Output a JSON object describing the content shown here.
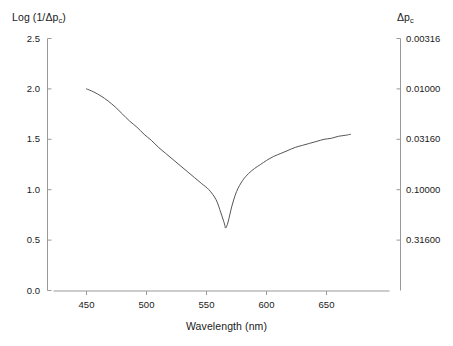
{
  "chart_data": {
    "type": "line",
    "title": "",
    "xlabel": "Wavelength (nm)",
    "ylabel": "Log (1/Δp_c)",
    "ylabel_right": "Δp_c",
    "xlim": [
      420,
      680
    ],
    "ylim": [
      0.0,
      2.5
    ],
    "grid": false,
    "legend": null,
    "xticks": [
      450,
      500,
      550,
      600,
      650
    ],
    "xticklabels": [
      "450",
      "500",
      "550",
      "600",
      "650"
    ],
    "yticks": [
      0.0,
      0.5,
      1.0,
      1.5,
      2.0,
      2.5
    ],
    "yticklabels": [
      "0.0",
      "0.5",
      "1.0",
      "1.5",
      "2.0",
      "2.5"
    ],
    "yticks_right_positions": [
      2.5,
      2.0,
      1.5,
      1.0,
      0.5
    ],
    "yticklabels_right": [
      "0.00316",
      "0.01000",
      "0.03160",
      "0.10000",
      "0.31600"
    ],
    "line_color": "#555555",
    "axis_color": "#999999",
    "series": [
      {
        "name": "spectral sensitivity",
        "x": [
          450,
          456,
          462,
          468,
          474,
          480,
          486,
          492,
          498,
          504,
          510,
          516,
          522,
          528,
          534,
          540,
          546,
          552,
          558,
          562,
          565,
          566,
          568,
          571,
          575,
          580,
          585,
          590,
          595,
          600,
          606,
          612,
          618,
          624,
          630,
          636,
          642,
          648,
          654,
          660,
          666,
          670
        ],
        "y": [
          2.0,
          1.97,
          1.93,
          1.88,
          1.82,
          1.75,
          1.68,
          1.62,
          1.55,
          1.49,
          1.42,
          1.36,
          1.3,
          1.24,
          1.18,
          1.12,
          1.06,
          1.0,
          0.9,
          0.77,
          0.66,
          0.62,
          0.68,
          0.83,
          0.98,
          1.09,
          1.16,
          1.21,
          1.25,
          1.29,
          1.33,
          1.36,
          1.39,
          1.42,
          1.44,
          1.46,
          1.48,
          1.5,
          1.51,
          1.53,
          1.54,
          1.55
        ]
      }
    ]
  },
  "labels": {
    "left_axis_title_prefix": "Log (1/Δp",
    "left_axis_title_sub": "c",
    "left_axis_title_suffix": ")",
    "right_axis_title_prefix": "Δp",
    "right_axis_title_sub": "c",
    "x_axis_title": "Wavelength (nm)"
  }
}
